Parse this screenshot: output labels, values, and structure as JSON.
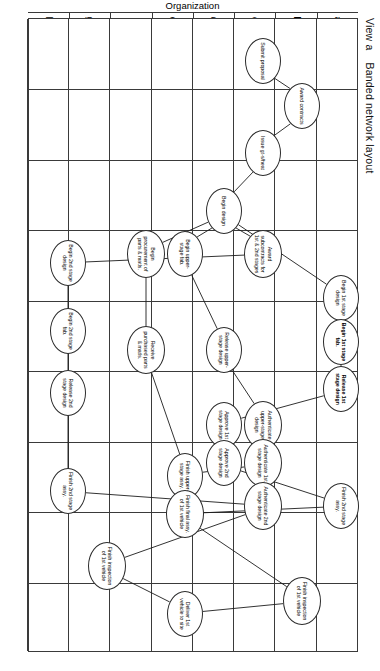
{
  "figure": {
    "view_label": "View a",
    "title": "Banded network layout",
    "axis_title": "Organization",
    "bands": [
      "a",
      "b",
      "c",
      "d",
      "e",
      "f",
      "g",
      "h"
    ],
    "band_count": 8,
    "time_column_count": 9,
    "line_color": "#1c1c1c",
    "frame_color": "#3a3a3a",
    "background": "#ffffff"
  },
  "nodes": [
    {
      "id": "n1",
      "band": "c",
      "label": "Submit proposal",
      "bold": false,
      "x": 60,
      "y": 116,
      "w": 46,
      "h": 36
    },
    {
      "id": "n2",
      "band": "b",
      "label": "Award contracts",
      "bold": false,
      "x": 105,
      "y": 77,
      "w": 46,
      "h": 36
    },
    {
      "id": "n3",
      "band": "c",
      "label": "Issue gt-s/heat",
      "bold": false,
      "x": 152,
      "y": 116,
      "w": 46,
      "h": 36
    },
    {
      "id": "n4",
      "band": "d",
      "label": "Begin design",
      "bold": false,
      "x": 210,
      "y": 155,
      "w": 46,
      "h": 36
    },
    {
      "id": "n5",
      "band": "c",
      "label": "Award subcontracts for 1st & 2nd stages",
      "bold": false,
      "x": 253,
      "y": 116,
      "w": 48,
      "h": 38
    },
    {
      "id": "n6",
      "band": "e",
      "label": "Begin upper-stage fab.",
      "bold": false,
      "x": 253,
      "y": 194,
      "w": 46,
      "h": 36
    },
    {
      "id": "n7",
      "band": "f",
      "label": "Begin procurement of parts & matls.",
      "bold": false,
      "x": 253,
      "y": 233,
      "w": 48,
      "h": 38
    },
    {
      "id": "n8",
      "band": "h",
      "label": "Begin 2nd stage design",
      "bold": false,
      "x": 262,
      "y": 311,
      "w": 46,
      "h": 36
    },
    {
      "id": "n9",
      "band": "a",
      "label": "Begin 1st stage design",
      "bold": false,
      "x": 297,
      "y": 38,
      "w": 46,
      "h": 36
    },
    {
      "id": "n10",
      "band": "h",
      "label": "Begin 2nd stage fab.",
      "bold": false,
      "x": 330,
      "y": 311,
      "w": 46,
      "h": 36
    },
    {
      "id": "n11",
      "band": "a",
      "label": "Begin 1st stage fab.",
      "bold": true,
      "x": 341,
      "y": 38,
      "w": 46,
      "h": 36
    },
    {
      "id": "n12",
      "band": "d",
      "label": "Release upper-stage design",
      "bold": false,
      "x": 349,
      "y": 155,
      "w": 46,
      "h": 36
    },
    {
      "id": "n13",
      "band": "f",
      "label": "Receive purchased parts & matls.",
      "bold": false,
      "x": 349,
      "y": 233,
      "w": 48,
      "h": 38
    },
    {
      "id": "n14",
      "band": "a",
      "label": "Release 1st stage design",
      "bold": true,
      "x": 388,
      "y": 38,
      "w": 46,
      "h": 36
    },
    {
      "id": "n15",
      "band": "h",
      "label": "Release 2nd stage design",
      "bold": false,
      "x": 392,
      "y": 311,
      "w": 46,
      "h": 36
    },
    {
      "id": "n16",
      "band": "c",
      "label": "Authenticate upper-stage design",
      "bold": false,
      "x": 424,
      "y": 116,
      "w": 48,
      "h": 38
    },
    {
      "id": "n17",
      "band": "d",
      "label": "Approve 1st stage design",
      "bold": false,
      "x": 424,
      "y": 155,
      "w": 46,
      "h": 36
    },
    {
      "id": "n18",
      "band": "c",
      "label": "Authenticate 1st stage design",
      "bold": false,
      "x": 462,
      "y": 116,
      "w": 48,
      "h": 38
    },
    {
      "id": "n19",
      "band": "d",
      "label": "Approve 2nd stage design",
      "bold": false,
      "x": 462,
      "y": 155,
      "w": 46,
      "h": 36
    },
    {
      "id": "n20",
      "band": "e",
      "label": "Finish upper-stage assy.",
      "bold": false,
      "x": 475,
      "y": 194,
      "w": 46,
      "h": 36
    },
    {
      "id": "n21",
      "band": "h",
      "label": "Finish 2nd stage assy.",
      "bold": false,
      "x": 490,
      "y": 311,
      "w": 46,
      "h": 36
    },
    {
      "id": "n22",
      "band": "a",
      "label": "Finish 2nd stage assy.",
      "bold": false,
      "x": 505,
      "y": 38,
      "w": 46,
      "h": 36
    },
    {
      "id": "n23",
      "band": "c",
      "label": "Authenticate 2nd stage design",
      "bold": false,
      "x": 505,
      "y": 116,
      "w": 48,
      "h": 38
    },
    {
      "id": "n24",
      "band": "e",
      "label": "Finish final assy. of 1st vehicle",
      "bold": false,
      "x": 513,
      "y": 194,
      "w": 48,
      "h": 38
    },
    {
      "id": "n25",
      "band": "g",
      "label": "Finish inspection of 1st vehicle",
      "bold": false,
      "x": 565,
      "y": 272,
      "w": 48,
      "h": 38
    },
    {
      "id": "n26",
      "band": "b",
      "label": "Finish inspection of 1st vehicle",
      "bold": false,
      "x": 600,
      "y": 77,
      "w": 48,
      "h": 38
    },
    {
      "id": "n27",
      "band": "e",
      "label": "Deliver 1st vehicle to site",
      "bold": false,
      "x": 613,
      "y": 194,
      "w": 46,
      "h": 36
    }
  ],
  "edges": [
    {
      "from": "n1",
      "to": "n2"
    },
    {
      "from": "n2",
      "to": "n3"
    },
    {
      "from": "n3",
      "to": "n4"
    },
    {
      "from": "n4",
      "to": "n5"
    },
    {
      "from": "n4",
      "to": "n6"
    },
    {
      "from": "n4",
      "to": "n7"
    },
    {
      "from": "n4",
      "to": "n9"
    },
    {
      "from": "n5",
      "to": "n8"
    },
    {
      "from": "n6",
      "to": "n12"
    },
    {
      "from": "n7",
      "to": "n13"
    },
    {
      "from": "n8",
      "to": "n10"
    },
    {
      "from": "n9",
      "to": "n11"
    },
    {
      "from": "n10",
      "to": "n15"
    },
    {
      "from": "n11",
      "to": "n14"
    },
    {
      "from": "n12",
      "to": "n16"
    },
    {
      "from": "n13",
      "to": "n20"
    },
    {
      "from": "n14",
      "to": "n17"
    },
    {
      "from": "n15",
      "to": "n21"
    },
    {
      "from": "n16",
      "to": "n18"
    },
    {
      "from": "n17",
      "to": "n19"
    },
    {
      "from": "n18",
      "to": "n20"
    },
    {
      "from": "n19",
      "to": "n22"
    },
    {
      "from": "n20",
      "to": "n24"
    },
    {
      "from": "n21",
      "to": "n23"
    },
    {
      "from": "n22",
      "to": "n24"
    },
    {
      "from": "n23",
      "to": "n25"
    },
    {
      "from": "n24",
      "to": "n26"
    },
    {
      "from": "n25",
      "to": "n27"
    },
    {
      "from": "n26",
      "to": "n27"
    }
  ]
}
